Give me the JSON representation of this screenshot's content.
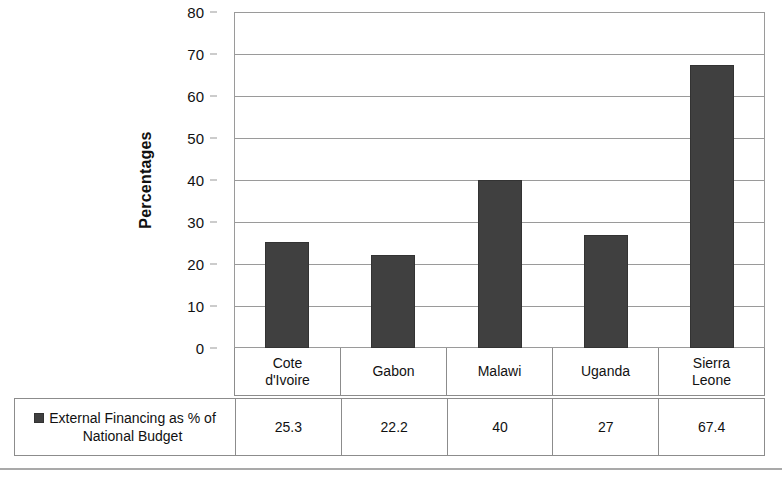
{
  "chart_data": {
    "type": "bar",
    "title": "",
    "xlabel": "",
    "ylabel": "Percentages",
    "ylim": [
      0,
      80
    ],
    "ytick_step": 10,
    "yticks": [
      80,
      70,
      60,
      50,
      40,
      30,
      20,
      10,
      0
    ],
    "grid": true,
    "legend_position": "bottom-table",
    "categories": [
      "Cote d'Ivoire",
      "Gabon",
      "Malawi",
      "Uganda",
      "Sierra Leone"
    ],
    "category_lines": [
      [
        "Cote",
        "d'Ivoire"
      ],
      [
        "Gabon"
      ],
      [
        "Malawi"
      ],
      [
        "Uganda"
      ],
      [
        "Sierra",
        "Leone"
      ]
    ],
    "series": [
      {
        "name": "External Financing as % of National Budget",
        "values": [
          25.3,
          22.2,
          40,
          27,
          67.4
        ],
        "value_labels": [
          "25.3",
          "22.2",
          "40",
          "27",
          "67.4"
        ],
        "color": "#404040"
      }
    ]
  },
  "axis": {
    "y_title": "Percentages"
  },
  "legend": {
    "marker_name": "legend-color-swatch",
    "label_line1": "External Financing as % of",
    "label_line2": "National Budget",
    "color": "#404040"
  },
  "colors": {
    "bar_fill": "#404040",
    "bar_stroke": "#333333",
    "gridline": "#9a9a9a",
    "table_border": "#8c8c8c",
    "text": "#111111",
    "background": "#ffffff"
  }
}
